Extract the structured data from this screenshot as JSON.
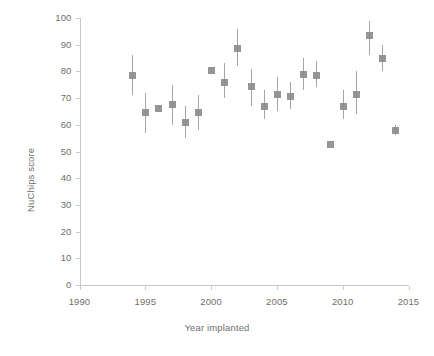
{
  "chart_data": {
    "type": "scatter",
    "title": "",
    "subtitle": "",
    "xlabel": "Year implanted",
    "ylabel": "NuChips score",
    "xlim": [
      1990,
      2015
    ],
    "ylim": [
      0,
      100
    ],
    "xticks": [
      1990,
      1995,
      2000,
      2005,
      2010,
      2015
    ],
    "yticks": [
      0,
      10,
      20,
      30,
      40,
      50,
      60,
      70,
      80,
      90,
      100
    ],
    "xtick_labels": [
      "1990",
      "1995",
      "2000",
      "2005",
      "2010",
      "2015"
    ],
    "ytick_labels": [
      "0",
      "10",
      "20",
      "30",
      "40",
      "50",
      "60",
      "70",
      "80",
      "90",
      "100"
    ],
    "grid": false,
    "legend": null,
    "legend_position": "none",
    "marker_shape": "square",
    "marker_color": "#8c8c8c",
    "errorbar_color": "#a5a5a5",
    "axis_color": "#c9c9c9",
    "error_bars": true,
    "x": [
      1994,
      1995,
      1996,
      1997,
      1998,
      1999,
      2000,
      2001,
      2002,
      2003,
      2004,
      2005,
      2006,
      2007,
      2008,
      2009,
      2010,
      2011,
      2012,
      2013,
      2014
    ],
    "values": [
      78.5,
      64.5,
      66.0,
      67.5,
      61.0,
      64.5,
      80.5,
      76.0,
      88.5,
      74.5,
      67.0,
      71.5,
      70.5,
      79.0,
      78.5,
      52.5,
      67.0,
      71.5,
      93.5,
      85.0,
      58.0
    ],
    "y_low": [
      71.0,
      57.0,
      66.0,
      60.0,
      55.0,
      58.0,
      80.5,
      70.0,
      82.0,
      67.0,
      62.0,
      65.0,
      66.0,
      73.0,
      74.0,
      52.5,
      62.0,
      64.0,
      86.0,
      80.0,
      56.0
    ],
    "y_high": [
      86.0,
      72.0,
      66.0,
      75.0,
      67.0,
      71.0,
      80.5,
      83.0,
      96.0,
      81.0,
      73.0,
      78.0,
      76.0,
      85.0,
      84.0,
      52.5,
      73.0,
      80.0,
      99.0,
      90.0,
      60.0
    ],
    "points": [
      {
        "x": 1994,
        "y": 78.5,
        "low": 71.0,
        "high": 86.0
      },
      {
        "x": 1995,
        "y": 64.5,
        "low": 57.0,
        "high": 72.0
      },
      {
        "x": 1996,
        "y": 66.0,
        "low": 66.0,
        "high": 66.0
      },
      {
        "x": 1997,
        "y": 67.5,
        "low": 60.0,
        "high": 75.0
      },
      {
        "x": 1998,
        "y": 61.0,
        "low": 55.0,
        "high": 67.0
      },
      {
        "x": 1999,
        "y": 64.5,
        "low": 58.0,
        "high": 71.0
      },
      {
        "x": 2000,
        "y": 80.5,
        "low": 80.5,
        "high": 80.5
      },
      {
        "x": 2001,
        "y": 76.0,
        "low": 70.0,
        "high": 83.0
      },
      {
        "x": 2002,
        "y": 88.5,
        "low": 82.0,
        "high": 96.0
      },
      {
        "x": 2003,
        "y": 74.5,
        "low": 67.0,
        "high": 81.0
      },
      {
        "x": 2004,
        "y": 67.0,
        "low": 62.0,
        "high": 73.0
      },
      {
        "x": 2005,
        "y": 71.5,
        "low": 65.0,
        "high": 78.0
      },
      {
        "x": 2006,
        "y": 70.5,
        "low": 66.0,
        "high": 76.0
      },
      {
        "x": 2007,
        "y": 79.0,
        "low": 73.0,
        "high": 85.0
      },
      {
        "x": 2008,
        "y": 78.5,
        "low": 74.0,
        "high": 84.0
      },
      {
        "x": 2009,
        "y": 52.5,
        "low": 52.5,
        "high": 52.5
      },
      {
        "x": 2010,
        "y": 67.0,
        "low": 62.0,
        "high": 73.0
      },
      {
        "x": 2011,
        "y": 71.5,
        "low": 64.0,
        "high": 80.0
      },
      {
        "x": 2012,
        "y": 93.5,
        "low": 86.0,
        "high": 99.0
      },
      {
        "x": 2013,
        "y": 85.0,
        "low": 80.0,
        "high": 90.0
      },
      {
        "x": 2014,
        "y": 58.0,
        "low": 56.0,
        "high": 60.0
      }
    ]
  }
}
